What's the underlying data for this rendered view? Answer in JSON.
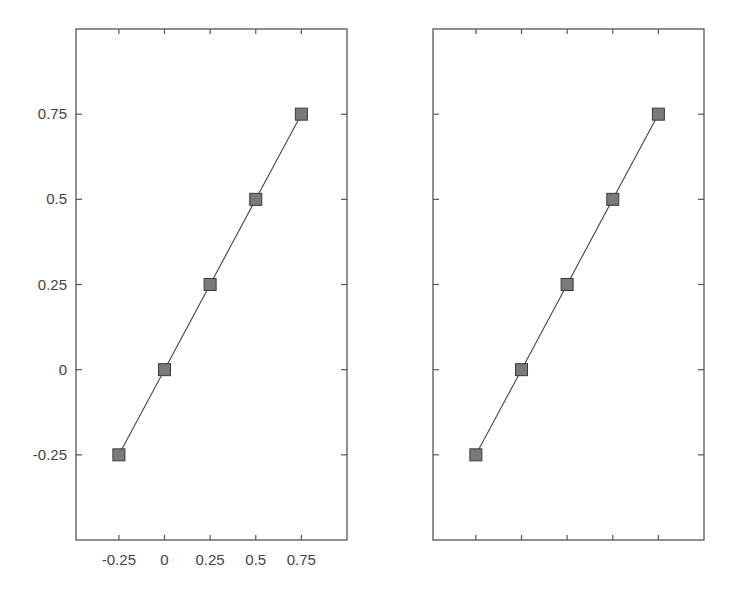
{
  "chart_data": [
    {
      "type": "line",
      "panel": "left",
      "title": "",
      "xlabel": "",
      "ylabel": "",
      "x": [
        -0.25,
        0,
        0.25,
        0.5,
        0.75
      ],
      "series": [
        {
          "name": "y = x",
          "values": [
            -0.25,
            0,
            0.25,
            0.5,
            0.75
          ],
          "marker": "square",
          "marker_color": "#7a7a7a",
          "line_color": "#444444"
        }
      ],
      "xticks": [
        -0.25,
        0,
        0.25,
        0.5,
        0.75
      ],
      "xtick_labels": [
        "-0.25",
        "0",
        "0.25",
        "0.5",
        "0.75"
      ],
      "yticks": [
        -0.25,
        0,
        0.25,
        0.5,
        0.75
      ],
      "ytick_labels": [
        "-0.25",
        "0",
        "0.25",
        "0.5",
        "0.75"
      ],
      "xlim": [
        -0.485,
        1.0
      ],
      "ylim": [
        -0.5,
        1.0
      ],
      "grid": false,
      "legend": null
    },
    {
      "type": "line",
      "panel": "right",
      "title": "",
      "xlabel": "",
      "ylabel": "",
      "x": [
        -0.25,
        0,
        0.25,
        0.5,
        0.75
      ],
      "series": [
        {
          "name": "y = x",
          "values": [
            -0.25,
            0,
            0.25,
            0.5,
            0.75
          ],
          "marker": "square",
          "marker_color": "#7a7a7a",
          "line_color": "#444444"
        }
      ],
      "xticks": [
        -0.25,
        0,
        0.25,
        0.5,
        0.75
      ],
      "xtick_labels": [],
      "yticks": [
        -0.25,
        0,
        0.25,
        0.5,
        0.75
      ],
      "ytick_labels": [],
      "xlim": [
        -0.485,
        1.0
      ],
      "ylim": [
        -0.5,
        1.0
      ],
      "grid": false,
      "legend": null
    }
  ],
  "panels": [
    {
      "name": "left-plot",
      "box": {
        "x": 76,
        "y": 29,
        "w": 271,
        "h": 511
      },
      "show_tick_labels": true
    },
    {
      "name": "right-plot",
      "box": {
        "x": 433,
        "y": 29,
        "w": 271,
        "h": 511
      },
      "show_tick_labels": false
    }
  ],
  "style": {
    "axis_color": "#555555",
    "line_color": "#444444",
    "marker_fill": "#7a7a7a",
    "marker_stroke": "#3a3a3a",
    "label_color": "#444444"
  }
}
